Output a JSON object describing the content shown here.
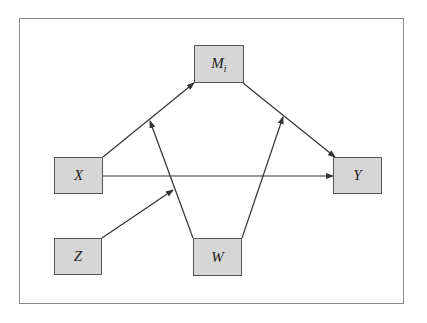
{
  "diagram": {
    "type": "path-model",
    "colors": {
      "node_fill": "#d6d6d6",
      "node_border": "#555555",
      "edge": "#333333",
      "frame": "#8a8a8a"
    },
    "nodes": [
      {
        "id": "M",
        "label": "M",
        "subscript": "i",
        "x": 194,
        "y": 45,
        "w": 50,
        "h": 38
      },
      {
        "id": "X",
        "label": "X",
        "subscript": "",
        "x": 54,
        "y": 157,
        "w": 49,
        "h": 37
      },
      {
        "id": "Y",
        "label": "Y",
        "subscript": "",
        "x": 333,
        "y": 157,
        "w": 49,
        "h": 37
      },
      {
        "id": "Z",
        "label": "Z",
        "subscript": "",
        "x": 54,
        "y": 238,
        "w": 48,
        "h": 37
      },
      {
        "id": "W",
        "label": "W",
        "subscript": "",
        "x": 193,
        "y": 238,
        "w": 49,
        "h": 38
      }
    ],
    "edges": [
      {
        "from": "X",
        "to": "M",
        "x1": 103,
        "y1": 157,
        "x2": 194,
        "y2": 83
      },
      {
        "from": "M",
        "to": "Y",
        "x1": 243,
        "y1": 83,
        "x2": 335,
        "y2": 157
      },
      {
        "from": "X",
        "to": "Y",
        "x1": 103,
        "y1": 176,
        "x2": 333,
        "y2": 176
      },
      {
        "from": "W",
        "to": "X->M path",
        "x1": 193,
        "y1": 238,
        "x2": 150,
        "y2": 121
      },
      {
        "from": "W",
        "to": "M->Y path",
        "x1": 242,
        "y1": 238,
        "x2": 283,
        "y2": 117
      },
      {
        "from": "Z",
        "to": "W->(X->M) path",
        "x1": 102,
        "y1": 238,
        "x2": 173,
        "y2": 190
      }
    ]
  }
}
